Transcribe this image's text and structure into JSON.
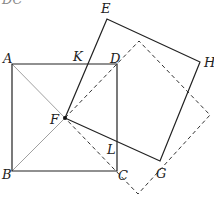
{
  "diagram": {
    "partial_text_top": "DC",
    "points": {
      "A": {
        "label": "A",
        "x": 12,
        "y": 64
      },
      "B": {
        "label": "B",
        "x": 12,
        "y": 171
      },
      "C": {
        "label": "C",
        "x": 117,
        "y": 171
      },
      "D": {
        "label": "D",
        "x": 117,
        "y": 64
      },
      "E": {
        "label": "E",
        "x": 107,
        "y": 19
      },
      "F": {
        "label": "F",
        "x": 65,
        "y": 118
      },
      "G": {
        "label": "G",
        "x": 160,
        "y": 161
      },
      "H": {
        "label": "H",
        "x": 200,
        "y": 62
      },
      "K": {
        "label": "K",
        "x": 87,
        "y": 64
      },
      "L": {
        "label": "L",
        "x": 117,
        "y": 142
      }
    },
    "shapes": [
      {
        "name": "square-ABCD",
        "style": "solid",
        "vertices": [
          "A",
          "B",
          "C",
          "D"
        ]
      },
      {
        "name": "square-EFGH",
        "style": "solid",
        "vertices": [
          "E",
          "F",
          "G",
          "H"
        ]
      },
      {
        "name": "dashed-square",
        "style": "dashed",
        "vertices": [
          [
            65,
            118
          ],
          [
            139,
            41
          ],
          [
            210,
            115
          ],
          [
            138,
            194
          ]
        ]
      },
      {
        "name": "diagonal-AF",
        "style": "thin",
        "from": "A",
        "to": "F"
      },
      {
        "name": "diagonal-BF",
        "style": "thin",
        "from": "B",
        "to": "F"
      }
    ],
    "colors": {
      "stroke": "#222222",
      "thin": "#666666",
      "background": "#ffffff"
    }
  }
}
